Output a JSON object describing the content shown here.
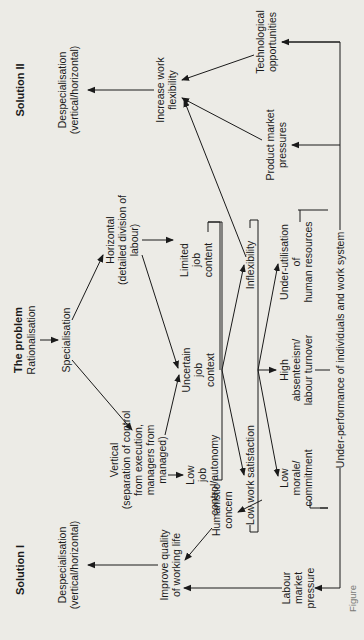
{
  "diagram": {
    "headings": {
      "solution1": "Solution I",
      "problem": "The problem",
      "solution2": "Solution II"
    },
    "nodes": {
      "rationalisation": [
        "Rationalisation"
      ],
      "specialisation": [
        "Specialisation"
      ],
      "horizontal": [
        "Horizontal",
        "(detailed division of",
        "labour)"
      ],
      "vertical": [
        "Vertical",
        "(separation of control",
        "from execution,",
        "managers from",
        "managed)"
      ],
      "limited_job_content": [
        "Limited",
        "job",
        "content"
      ],
      "uncertain_job_context": [
        "Uncertain",
        "job",
        "context"
      ],
      "low_job_control": [
        "Low",
        "job",
        "control/autonomy"
      ],
      "inflexibility": [
        "Inflexibility"
      ],
      "low_work_satisfaction": [
        "Low work satisfaction"
      ],
      "under_utilisation": [
        "Under-utilisation",
        "of",
        "human resources"
      ],
      "high_absenteeism": [
        "High",
        "absenteeism/",
        "labour turnover"
      ],
      "low_morale": [
        "Low",
        "morale/",
        "commitment"
      ],
      "under_performance": [
        "Under-performance of individuals and work system"
      ],
      "increase_flexibility": [
        "Increase work",
        "flexibility"
      ],
      "technological_opportunities": [
        "Technological",
        "opportunities"
      ],
      "product_market_pressures": [
        "Product market",
        "pressures"
      ],
      "despecialisation_2": [
        "Despecialisation",
        "(vertical/horizontal)"
      ],
      "humanistic_concern": [
        "Humanistic",
        "concern"
      ],
      "improve_qwl": [
        "Improve quality",
        "of working life"
      ],
      "labour_market_pressure": [
        "Labour",
        "market",
        "pressure"
      ],
      "despecialisation_1": [
        "Despecialisation",
        "(vertical/horizontal)"
      ]
    },
    "caption": "Figure"
  },
  "colors": {
    "paper": "#ecebe6",
    "ink": "#1a1a1a"
  }
}
